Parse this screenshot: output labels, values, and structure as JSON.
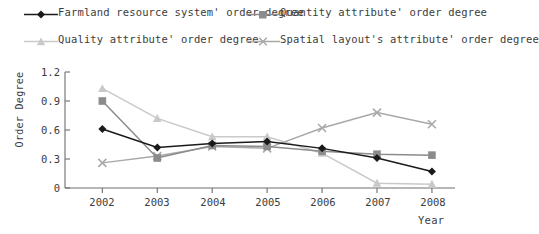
{
  "chart_data": {
    "type": "line",
    "title": "",
    "xlabel": "Year",
    "ylabel": "Order Degree",
    "categories": [
      "2002",
      "2003",
      "2004",
      "2005",
      "2006",
      "2007",
      "2008"
    ],
    "x": [
      2002,
      2003,
      2004,
      2005,
      2006,
      2007,
      2008
    ],
    "ylim": [
      0,
      1.2
    ],
    "yticks": [
      "0",
      "0.3",
      "0.6",
      "0.9",
      "1.2"
    ],
    "ytick_values": [
      0,
      0.3,
      0.6,
      0.9,
      1.2
    ],
    "grid": false,
    "legend_position": "top",
    "series": [
      {
        "name": "Farmland resource system' order degree",
        "marker": "diamond",
        "color": "#1a1a1a",
        "values": [
          0.61,
          0.42,
          0.46,
          0.48,
          0.41,
          0.31,
          0.17
        ]
      },
      {
        "name": "Quantity attribute' order degree",
        "marker": "square",
        "color": "#8c8c8c",
        "values": [
          0.9,
          0.31,
          0.44,
          0.43,
          0.38,
          0.35,
          0.34
        ]
      },
      {
        "name": "Quality attribute' order degree",
        "marker": "triangle",
        "color": "#c9c9c9",
        "values": [
          1.03,
          0.72,
          0.53,
          0.53,
          0.36,
          0.05,
          0.04
        ]
      },
      {
        "name": "Spatial layout's attribute' order degree",
        "marker": "cross",
        "color": "#a8a8a8",
        "values": [
          0.26,
          0.33,
          0.43,
          0.41,
          0.62,
          0.78,
          0.66
        ]
      }
    ]
  },
  "axis": {
    "color": "#6e6e6e"
  }
}
